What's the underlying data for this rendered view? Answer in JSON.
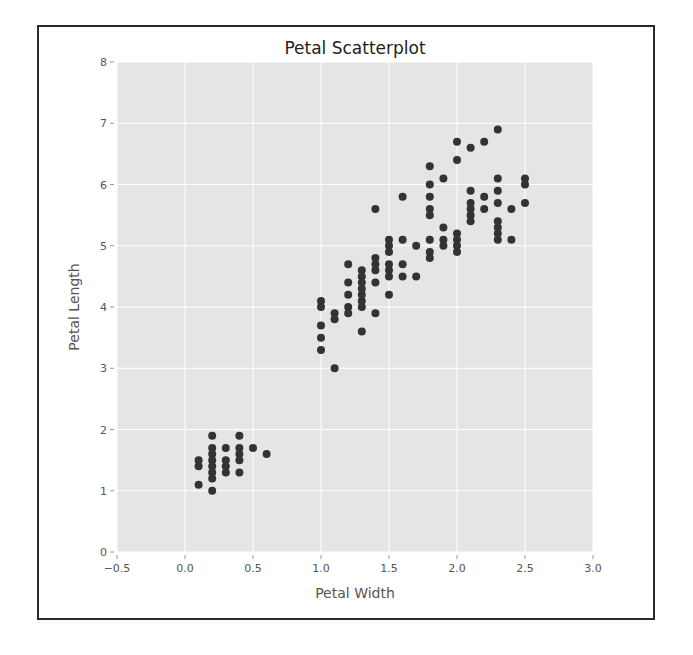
{
  "chart_data": {
    "type": "scatter",
    "title": "Petal Scatterplot",
    "xlabel": "Petal Width",
    "ylabel": "Petal Length",
    "xlim": [
      -0.5,
      3.0
    ],
    "ylim": [
      0,
      8
    ],
    "xticks": [
      "-0.5",
      "0.0",
      "0.5",
      "1.0",
      "1.5",
      "2.0",
      "2.5",
      "3.0"
    ],
    "yticks": [
      "0",
      "1",
      "2",
      "3",
      "4",
      "5",
      "6",
      "7",
      "8"
    ],
    "grid": true,
    "legend": null,
    "background": "#e5e5e5",
    "gridline_color": "#ffffff",
    "marker_color": "#333333",
    "series": [
      {
        "name": "petal",
        "points": [
          [
            0.1,
            1.5
          ],
          [
            0.1,
            1.4
          ],
          [
            0.1,
            1.1
          ],
          [
            0.2,
            1.9
          ],
          [
            0.2,
            1.7
          ],
          [
            0.2,
            1.6
          ],
          [
            0.2,
            1.5
          ],
          [
            0.2,
            1.4
          ],
          [
            0.2,
            1.3
          ],
          [
            0.2,
            1.2
          ],
          [
            0.2,
            1.0
          ],
          [
            0.3,
            1.7
          ],
          [
            0.3,
            1.5
          ],
          [
            0.3,
            1.4
          ],
          [
            0.3,
            1.3
          ],
          [
            0.4,
            1.9
          ],
          [
            0.4,
            1.7
          ],
          [
            0.4,
            1.6
          ],
          [
            0.4,
            1.5
          ],
          [
            0.4,
            1.3
          ],
          [
            0.5,
            1.7
          ],
          [
            0.6,
            1.6
          ],
          [
            1.0,
            4.1
          ],
          [
            1.0,
            4.0
          ],
          [
            1.0,
            3.7
          ],
          [
            1.0,
            3.5
          ],
          [
            1.0,
            3.3
          ],
          [
            1.1,
            3.9
          ],
          [
            1.1,
            3.8
          ],
          [
            1.1,
            3.0
          ],
          [
            1.2,
            4.7
          ],
          [
            1.2,
            4.4
          ],
          [
            1.2,
            4.2
          ],
          [
            1.2,
            4.0
          ],
          [
            1.2,
            3.9
          ],
          [
            1.3,
            4.6
          ],
          [
            1.3,
            4.5
          ],
          [
            1.3,
            4.4
          ],
          [
            1.3,
            4.3
          ],
          [
            1.3,
            4.2
          ],
          [
            1.3,
            4.1
          ],
          [
            1.3,
            4.0
          ],
          [
            1.3,
            3.6
          ],
          [
            1.4,
            5.6
          ],
          [
            1.4,
            4.8
          ],
          [
            1.4,
            4.7
          ],
          [
            1.4,
            4.6
          ],
          [
            1.4,
            4.4
          ],
          [
            1.4,
            3.9
          ],
          [
            1.5,
            5.1
          ],
          [
            1.5,
            5.0
          ],
          [
            1.5,
            4.9
          ],
          [
            1.5,
            4.7
          ],
          [
            1.5,
            4.6
          ],
          [
            1.5,
            4.5
          ],
          [
            1.5,
            4.2
          ],
          [
            1.6,
            5.8
          ],
          [
            1.6,
            5.1
          ],
          [
            1.6,
            4.7
          ],
          [
            1.6,
            4.5
          ],
          [
            1.7,
            5.0
          ],
          [
            1.7,
            4.5
          ],
          [
            1.8,
            6.3
          ],
          [
            1.8,
            6.0
          ],
          [
            1.8,
            5.8
          ],
          [
            1.8,
            5.6
          ],
          [
            1.8,
            5.5
          ],
          [
            1.8,
            5.1
          ],
          [
            1.8,
            4.9
          ],
          [
            1.8,
            4.8
          ],
          [
            1.9,
            6.1
          ],
          [
            1.9,
            5.3
          ],
          [
            1.9,
            5.1
          ],
          [
            1.9,
            5.0
          ],
          [
            2.0,
            6.7
          ],
          [
            2.0,
            6.4
          ],
          [
            2.0,
            5.2
          ],
          [
            2.0,
            5.1
          ],
          [
            2.0,
            5.0
          ],
          [
            2.0,
            4.9
          ],
          [
            2.1,
            6.6
          ],
          [
            2.1,
            5.9
          ],
          [
            2.1,
            5.7
          ],
          [
            2.1,
            5.6
          ],
          [
            2.1,
            5.5
          ],
          [
            2.1,
            5.4
          ],
          [
            2.2,
            6.7
          ],
          [
            2.2,
            5.8
          ],
          [
            2.2,
            5.6
          ],
          [
            2.3,
            6.9
          ],
          [
            2.3,
            6.1
          ],
          [
            2.3,
            5.9
          ],
          [
            2.3,
            5.7
          ],
          [
            2.3,
            5.4
          ],
          [
            2.3,
            5.3
          ],
          [
            2.3,
            5.2
          ],
          [
            2.3,
            5.1
          ],
          [
            2.4,
            5.6
          ],
          [
            2.4,
            5.1
          ],
          [
            2.5,
            6.1
          ],
          [
            2.5,
            6.0
          ],
          [
            2.5,
            5.7
          ]
        ]
      }
    ]
  }
}
